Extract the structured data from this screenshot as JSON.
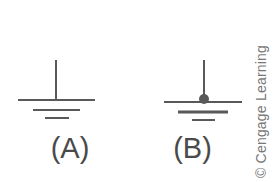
{
  "figure": {
    "kind": "electrical-schematic",
    "stroke_color": "#595959",
    "background_color": "#ffffff",
    "label_color": "#4a4a4a",
    "panels": [
      {
        "id": "a",
        "label": "(A)",
        "symbol_name": "earth-ground-symbol",
        "has_connection_node": false,
        "lead": {
          "x": 56,
          "y_top": 8,
          "y_bottom": 48
        },
        "bars": [
          {
            "name": "ground-bar-1",
            "x1": 18,
            "x2": 95,
            "y": 48,
            "thickness": 2
          },
          {
            "name": "ground-bar-2",
            "x1": 33,
            "x2": 80,
            "y": 58,
            "thickness": 2
          },
          {
            "name": "ground-bar-3",
            "x1": 45,
            "x2": 69,
            "y": 66,
            "thickness": 2
          }
        ]
      },
      {
        "id": "b",
        "label": "(B)",
        "symbol_name": "earth-ground-symbol-with-node",
        "has_connection_node": true,
        "lead": {
          "x": 64,
          "y_top": 8,
          "y_bottom": 48
        },
        "node": {
          "name": "connection-node-dot",
          "cx": 64,
          "cy": 47,
          "r": 5
        },
        "bars": [
          {
            "name": "ground-bar-1",
            "x1": 24,
            "x2": 102,
            "y": 50,
            "thickness": 2
          },
          {
            "name": "ground-bar-2",
            "x1": 38,
            "x2": 88,
            "y": 60,
            "thickness": 3
          },
          {
            "name": "ground-bar-3",
            "x1": 52,
            "x2": 75,
            "y": 68,
            "thickness": 2
          }
        ]
      }
    ]
  },
  "attribution": {
    "text": "© Cengage Learning",
    "symbol": "copyright-symbol",
    "orientation": "rotated-90-ccw",
    "color": "#777777"
  }
}
